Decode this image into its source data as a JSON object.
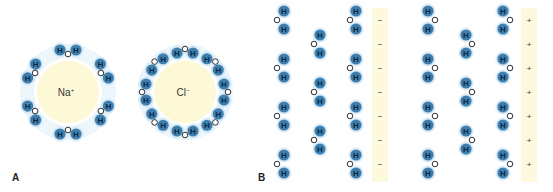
{
  "figure": {
    "panels": [
      {
        "id": "A",
        "label": "A",
        "ions": [
          {
            "name": "sodium-ion",
            "symbol": "Na",
            "charge": "+",
            "cx": 68,
            "cy": 92,
            "r": 31,
            "water_count": 6,
            "oxygen_facing": "inward"
          },
          {
            "name": "chloride-ion",
            "symbol": "Cl",
            "charge": "−",
            "cx": 185,
            "cy": 92,
            "r": 31,
            "water_count": 8,
            "oxygen_facing": "outward"
          }
        ]
      },
      {
        "id": "B",
        "label": "B",
        "plates": [
          {
            "name": "negative-plate",
            "x": 372,
            "width": 16,
            "sign": "−"
          },
          {
            "name": "positive-plate",
            "x": 521,
            "width": 16,
            "sign": "+"
          }
        ],
        "plate_y": [
          8,
          182
        ],
        "charge_rows_y": [
          20,
          44,
          68,
          92,
          116,
          140,
          164
        ],
        "water_columns": [
          {
            "group": "left",
            "h_x": 284,
            "o_x": 277,
            "rows_y": [
              20,
              68,
              116,
              164
            ]
          },
          {
            "group": "left",
            "h_x": 320,
            "o_x": 314,
            "rows_y": [
              44,
              92,
              140
            ]
          },
          {
            "group": "left",
            "h_x": 356,
            "o_x": 350,
            "rows_y": [
              20,
              68,
              116,
              164
            ]
          },
          {
            "group": "right",
            "h_x": 428,
            "o_x": 435,
            "rows_y": [
              20,
              68,
              116,
              164
            ]
          },
          {
            "group": "right",
            "h_x": 466,
            "o_x": 472,
            "rows_y": [
              44,
              92,
              140
            ]
          },
          {
            "group": "right",
            "h_x": 503,
            "o_x": 510,
            "rows_y": [
              20,
              68,
              116,
              164
            ]
          }
        ]
      }
    ],
    "atom_labels": {
      "hydrogen": "H",
      "oxygen": "O"
    },
    "colors": {
      "hydrogen_fill": "#3f7fae",
      "hydrogen_halo": "#cfe6f5",
      "hydrogen_text": "#0d2a44",
      "oxygen_stroke": "#333333",
      "ion_fill": "#fdf9d6",
      "plate_fill": "#fdf9dc",
      "text": "#333333"
    }
  }
}
